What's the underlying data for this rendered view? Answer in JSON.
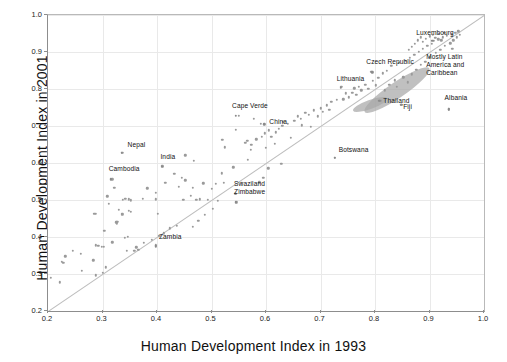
{
  "chart_data": {
    "type": "scatter",
    "title": "",
    "xlabel": "Human Development Index in 1993",
    "ylabel": "Human Development Index in 2001",
    "xlim": [
      0.2,
      1.0
    ],
    "ylim": [
      0.2,
      1.0
    ],
    "xticks": [
      "0.2",
      "0.3",
      "0.4",
      "0.5",
      "0.6",
      "0.7",
      "0.8",
      "0.9",
      "1.0"
    ],
    "yticks": [
      "0.2",
      "0.3",
      "0.4",
      "0.5",
      "0.6",
      "0.7",
      "0.8",
      "0.9",
      "1.0"
    ],
    "grid": true,
    "legend": "none",
    "reference_line": {
      "type": "identity",
      "from": [
        0.2,
        0.2
      ],
      "to": [
        1.0,
        1.0
      ]
    },
    "annotations": [
      {
        "text": "Nepal",
        "x": 0.335,
        "y": 0.628,
        "label_dx": 6,
        "label_dy": -6
      },
      {
        "text": "Cambodia",
        "x": 0.315,
        "y": 0.556,
        "label_dx": -2,
        "label_dy": -8
      },
      {
        "text": "India",
        "x": 0.41,
        "y": 0.59,
        "label_dx": -2,
        "label_dy": -8
      },
      {
        "text": "Cape Verde",
        "x": 0.545,
        "y": 0.727,
        "label_dx": -4,
        "label_dy": -8
      },
      {
        "text": "China",
        "x": 0.597,
        "y": 0.705,
        "label_dx": 5,
        "label_dy": 0
      },
      {
        "text": "Swaziland",
        "x": 0.545,
        "y": 0.517,
        "label_dx": -2,
        "label_dy": -8
      },
      {
        "text": "Zimbabwe",
        "x": 0.545,
        "y": 0.494,
        "label_dx": -2,
        "label_dy": -8
      },
      {
        "text": "Zambia",
        "x": 0.398,
        "y": 0.375,
        "label_dx": 3,
        "label_dy": -7
      },
      {
        "text": "Botswana",
        "x": 0.726,
        "y": 0.614,
        "label_dx": 4,
        "label_dy": -6
      },
      {
        "text": "Lithuania",
        "x": 0.737,
        "y": 0.804,
        "label_dx": -4,
        "label_dy": -7
      },
      {
        "text": "Czech Republic",
        "x": 0.795,
        "y": 0.845,
        "label_dx": -6,
        "label_dy": -8
      },
      {
        "text": "Luxembourg",
        "x": 0.905,
        "y": 0.93,
        "label_dx": -16,
        "label_dy": -6
      },
      {
        "text": "Thailand",
        "x": 0.808,
        "y": 0.768,
        "label_dx": 4,
        "label_dy": 2
      },
      {
        "text": "Fiji",
        "x": 0.848,
        "y": 0.758,
        "label_dx": 2,
        "label_dy": 4
      },
      {
        "text": "Albania",
        "x": 0.935,
        "y": 0.745,
        "label_dx": -4,
        "label_dy": -9
      },
      {
        "text": "Mostly Latin America and Caribbean",
        "x": 0.905,
        "y": 0.838,
        "label_dx": -6,
        "label_dy": -16,
        "multiline": true
      }
    ],
    "ellipses": [
      {
        "cx": 0.84,
        "cy": 0.798,
        "rx": 0.072,
        "ry": 0.022,
        "angle": -34
      },
      {
        "cx": 0.79,
        "cy": 0.758,
        "rx": 0.033,
        "ry": 0.012,
        "angle": -20
      }
    ],
    "points": [
      [
        0.205,
        0.29
      ],
      [
        0.222,
        0.278
      ],
      [
        0.232,
        0.348
      ],
      [
        0.225,
        0.333
      ],
      [
        0.228,
        0.33
      ],
      [
        0.245,
        0.362
      ],
      [
        0.26,
        0.355
      ],
      [
        0.283,
        0.337
      ],
      [
        0.262,
        0.308
      ],
      [
        0.288,
        0.378
      ],
      [
        0.292,
        0.376
      ],
      [
        0.299,
        0.373
      ],
      [
        0.302,
        0.374
      ],
      [
        0.285,
        0.463
      ],
      [
        0.288,
        0.463
      ],
      [
        0.303,
        0.417
      ],
      [
        0.309,
        0.51
      ],
      [
        0.312,
        0.489
      ],
      [
        0.318,
        0.386
      ],
      [
        0.322,
        0.533
      ],
      [
        0.325,
        0.44
      ],
      [
        0.326,
        0.437
      ],
      [
        0.327,
        0.441
      ],
      [
        0.33,
        0.474
      ],
      [
        0.336,
        0.463
      ],
      [
        0.336,
        0.46
      ],
      [
        0.341,
        0.398
      ],
      [
        0.346,
        0.401
      ],
      [
        0.348,
        0.47
      ],
      [
        0.352,
        0.468
      ],
      [
        0.345,
        0.363
      ],
      [
        0.358,
        0.362
      ],
      [
        0.337,
        0.5
      ],
      [
        0.342,
        0.503
      ],
      [
        0.348,
        0.502
      ],
      [
        0.374,
        0.504
      ],
      [
        0.366,
        0.366
      ],
      [
        0.352,
        0.499
      ],
      [
        0.382,
        0.532
      ],
      [
        0.398,
        0.502
      ],
      [
        0.402,
        0.462
      ],
      [
        0.398,
        0.519
      ],
      [
        0.415,
        0.547
      ],
      [
        0.336,
        0.628
      ],
      [
        0.318,
        0.556
      ],
      [
        0.41,
        0.592
      ],
      [
        0.432,
        0.571
      ],
      [
        0.44,
        0.536
      ],
      [
        0.448,
        0.501
      ],
      [
        0.452,
        0.553
      ],
      [
        0.462,
        0.511
      ],
      [
        0.466,
        0.533
      ],
      [
        0.398,
        0.378
      ],
      [
        0.472,
        0.501
      ],
      [
        0.478,
        0.502
      ],
      [
        0.468,
        0.606
      ],
      [
        0.445,
        0.56
      ],
      [
        0.452,
        0.621
      ],
      [
        0.485,
        0.545
      ],
      [
        0.493,
        0.5
      ],
      [
        0.5,
        0.53
      ],
      [
        0.508,
        0.543
      ],
      [
        0.512,
        0.498
      ],
      [
        0.519,
        0.572
      ],
      [
        0.523,
        0.546
      ],
      [
        0.54,
        0.588
      ],
      [
        0.544,
        0.517
      ],
      [
        0.546,
        0.494
      ],
      [
        0.52,
        0.663
      ],
      [
        0.524,
        0.642
      ],
      [
        0.55,
        0.727
      ],
      [
        0.545,
        0.69
      ],
      [
        0.562,
        0.655
      ],
      [
        0.566,
        0.66
      ],
      [
        0.573,
        0.649
      ],
      [
        0.572,
        0.636
      ],
      [
        0.567,
        0.608
      ],
      [
        0.578,
        0.72
      ],
      [
        0.59,
        0.706
      ],
      [
        0.582,
        0.664
      ],
      [
        0.592,
        0.671
      ],
      [
        0.6,
        0.641
      ],
      [
        0.598,
        0.68
      ],
      [
        0.605,
        0.688
      ],
      [
        0.61,
        0.67
      ],
      [
        0.616,
        0.652
      ],
      [
        0.618,
        0.683
      ],
      [
        0.623,
        0.692
      ],
      [
        0.63,
        0.7
      ],
      [
        0.632,
        0.712
      ],
      [
        0.64,
        0.706
      ],
      [
        0.645,
        0.668
      ],
      [
        0.652,
        0.714
      ],
      [
        0.658,
        0.726
      ],
      [
        0.664,
        0.72
      ],
      [
        0.666,
        0.702
      ],
      [
        0.672,
        0.736
      ],
      [
        0.678,
        0.73
      ],
      [
        0.682,
        0.698
      ],
      [
        0.688,
        0.742
      ],
      [
        0.695,
        0.726
      ],
      [
        0.7,
        0.748
      ],
      [
        0.704,
        0.738
      ],
      [
        0.712,
        0.756
      ],
      [
        0.716,
        0.744
      ],
      [
        0.72,
        0.765
      ],
      [
        0.726,
        0.614
      ],
      [
        0.73,
        0.77
      ],
      [
        0.738,
        0.806
      ],
      [
        0.742,
        0.772
      ],
      [
        0.746,
        0.788
      ],
      [
        0.752,
        0.778
      ],
      [
        0.758,
        0.79
      ],
      [
        0.762,
        0.802
      ],
      [
        0.766,
        0.784
      ],
      [
        0.77,
        0.806
      ],
      [
        0.775,
        0.796
      ],
      [
        0.782,
        0.812
      ],
      [
        0.788,
        0.8
      ],
      [
        0.793,
        0.846
      ],
      [
        0.796,
        0.822
      ],
      [
        0.802,
        0.81
      ],
      [
        0.806,
        0.83
      ],
      [
        0.81,
        0.768
      ],
      [
        0.814,
        0.842
      ],
      [
        0.818,
        0.796
      ],
      [
        0.822,
        0.85
      ],
      [
        0.826,
        0.812
      ],
      [
        0.83,
        0.862
      ],
      [
        0.836,
        0.824
      ],
      [
        0.84,
        0.806
      ],
      [
        0.844,
        0.87
      ],
      [
        0.848,
        0.758
      ],
      [
        0.852,
        0.832
      ],
      [
        0.856,
        0.876
      ],
      [
        0.86,
        0.818
      ],
      [
        0.864,
        0.884
      ],
      [
        0.868,
        0.84
      ],
      [
        0.872,
        0.892
      ],
      [
        0.876,
        0.852
      ],
      [
        0.88,
        0.9
      ],
      [
        0.884,
        0.866
      ],
      [
        0.888,
        0.908
      ],
      [
        0.892,
        0.874
      ],
      [
        0.896,
        0.916
      ],
      [
        0.9,
        0.886
      ],
      [
        0.904,
        0.922
      ],
      [
        0.908,
        0.93
      ],
      [
        0.912,
        0.898
      ],
      [
        0.916,
        0.934
      ],
      [
        0.92,
        0.906
      ],
      [
        0.924,
        0.94
      ],
      [
        0.928,
        0.916
      ],
      [
        0.932,
        0.944
      ],
      [
        0.935,
        0.745
      ],
      [
        0.938,
        0.924
      ],
      [
        0.941,
        0.948
      ],
      [
        0.944,
        0.932
      ],
      [
        0.947,
        0.952
      ],
      [
        0.95,
        0.94
      ],
      [
        0.953,
        0.956
      ],
      [
        0.956,
        0.946
      ],
      [
        0.9,
        0.942
      ],
      [
        0.906,
        0.946
      ],
      [
        0.911,
        0.938
      ],
      [
        0.917,
        0.95
      ],
      [
        0.922,
        0.932
      ],
      [
        0.927,
        0.952
      ],
      [
        0.893,
        0.936
      ],
      [
        0.888,
        0.928
      ],
      [
        0.884,
        0.94
      ],
      [
        0.878,
        0.932
      ],
      [
        0.873,
        0.922
      ],
      [
        0.868,
        0.914
      ],
      [
        0.862,
        0.906
      ],
      [
        0.942,
        0.908
      ],
      [
        0.628,
        0.598
      ],
      [
        0.604,
        0.586
      ],
      [
        0.595,
        0.56
      ],
      [
        0.588,
        0.548
      ],
      [
        0.556,
        0.546
      ],
      [
        0.502,
        0.476
      ],
      [
        0.488,
        0.46
      ],
      [
        0.476,
        0.444
      ],
      [
        0.466,
        0.428
      ],
      [
        0.436,
        0.43
      ],
      [
        0.424,
        0.424
      ],
      [
        0.412,
        0.41
      ],
      [
        0.404,
        0.404
      ],
      [
        0.39,
        0.392
      ],
      [
        0.376,
        0.384
      ],
      [
        0.362,
        0.372
      ],
      [
        0.3,
        0.304
      ],
      [
        0.288,
        0.296
      ],
      [
        0.306,
        0.318
      ]
    ]
  }
}
